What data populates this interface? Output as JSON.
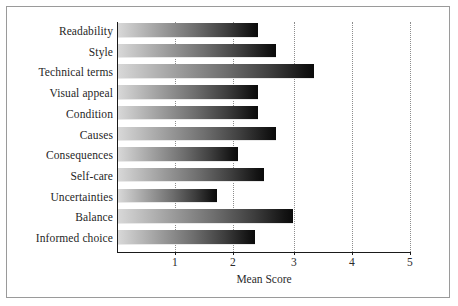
{
  "chart_data": {
    "type": "bar",
    "orientation": "horizontal",
    "title": "",
    "xlabel": "Mean Score",
    "ylabel": "",
    "xlim": [
      0,
      5
    ],
    "xticks": [
      "1",
      "2",
      "3",
      "4",
      "5"
    ],
    "grid": "vertical dotted gridlines at each x tick",
    "legend": "none",
    "bar_style": "horizontal gradient, light gray at left to black at right",
    "categories": [
      "Readability",
      "Style",
      "Technical terms",
      "Visual appeal",
      "Condition",
      "Causes",
      "Consequences",
      "Self-care",
      "Uncertainties",
      "Balance",
      "Informed choice"
    ],
    "values": [
      2.4,
      2.7,
      3.35,
      2.4,
      2.4,
      2.7,
      2.05,
      2.5,
      1.7,
      3.0,
      2.35
    ]
  },
  "axis": {
    "x_title": "Mean Score",
    "ticks": [
      {
        "label": "1",
        "value": 1
      },
      {
        "label": "2",
        "value": 2
      },
      {
        "label": "3",
        "value": 3
      },
      {
        "label": "4",
        "value": 4
      },
      {
        "label": "5",
        "value": 5
      }
    ]
  },
  "colors": {
    "frame": "#9a9a9a",
    "axis": "#1a1a1a",
    "gridline": "#8d8d8d",
    "bar_start": "#d8d8d8",
    "bar_end": "#0a0a0a",
    "text": "#1f1f1f",
    "background": "#ffffff"
  }
}
